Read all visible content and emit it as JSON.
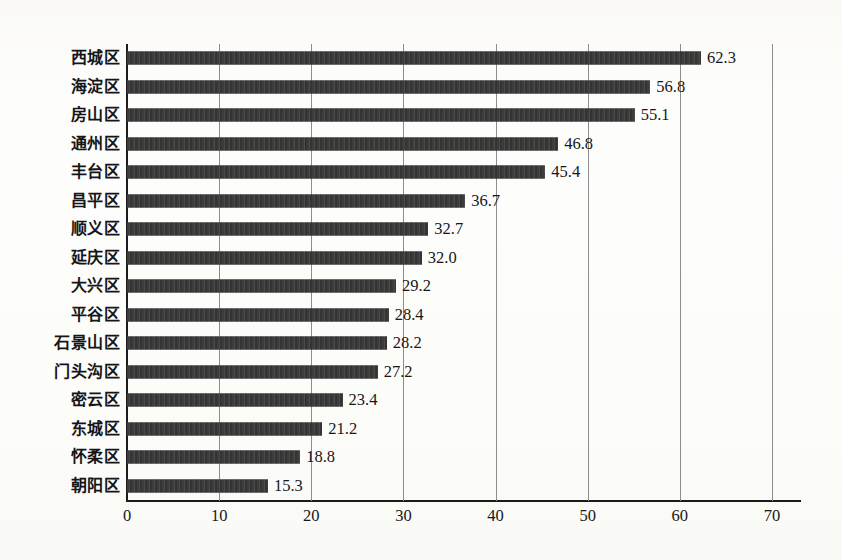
{
  "chart_data": {
    "type": "bar",
    "orientation": "horizontal",
    "title": "",
    "subtitle": "",
    "xlabel": "",
    "ylabel": "",
    "xlim": [
      0,
      70
    ],
    "xticks": [
      0,
      10,
      20,
      30,
      40,
      50,
      60,
      70
    ],
    "xtick_labels": [
      "0",
      "10",
      "20",
      "30",
      "40",
      "50",
      "60",
      "70"
    ],
    "grid": "vertical",
    "legend": "none",
    "bar_color": "#3d3d3d",
    "axis_color": "#1c1c1c",
    "gridline_color": "#8d8d8d",
    "background_color": "#fdfdfb",
    "categories": [
      "西城区",
      "海淀区",
      "房山区",
      "通州区",
      "丰台区",
      "昌平区",
      "顺义区",
      "延庆区",
      "大兴区",
      "平谷区",
      "石景山区",
      "门头沟区",
      "密云区",
      "东城区",
      "怀柔区",
      "朝阳区"
    ],
    "values": [
      62.3,
      56.8,
      55.1,
      46.8,
      45.4,
      36.7,
      32.7,
      32.0,
      29.2,
      28.4,
      28.2,
      27.2,
      23.4,
      21.2,
      18.8,
      15.3
    ],
    "value_labels": [
      "62.3",
      "56.8",
      "55.1",
      "46.8",
      "45.4",
      "36.7",
      "32.7",
      "32.0",
      "29.2",
      "28.4",
      "28.2",
      "27.2",
      "23.4",
      "21.2",
      "18.8",
      "15.3"
    ]
  }
}
